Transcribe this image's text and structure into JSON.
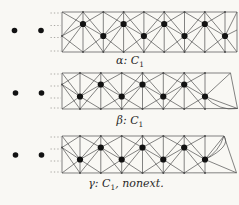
{
  "page": {
    "background": "#f9f8f4",
    "line_color": "#4f4f4f",
    "dot_color": "#121212",
    "junction_color": "#4f4f4f",
    "dashed_color": "#979490",
    "text_color": "#2a2a2a"
  },
  "strips": [
    {
      "id": "alpha",
      "label_parts": [
        {
          "text": "α: C"
        },
        {
          "text": "1",
          "sub": true
        }
      ],
      "label_pos": {
        "center_x": 130,
        "top": 55
      },
      "geom": {
        "left": 62,
        "top": 12,
        "bottom": 52,
        "dot_xs": [
          83,
          103.3,
          123.6,
          143.9,
          164.2,
          184.5,
          204.8,
          225
        ],
        "first_dot_row": "upper",
        "upper_y": 24,
        "lower_y": 36,
        "end": {
          "type": "flat",
          "right": 237
        }
      },
      "ellipsis_dots": [
        {
          "x": 14.5,
          "y": 30.5
        },
        {
          "x": 41,
          "y": 30.5
        }
      ]
    },
    {
      "id": "beta",
      "label_parts": [
        {
          "text": "β: C"
        },
        {
          "text": "1",
          "sub": true
        }
      ],
      "label_pos": {
        "center_x": 130,
        "top": 115
      },
      "geom": {
        "left": 62,
        "top": 73,
        "bottom": 109,
        "dot_xs": [
          80,
          100.8,
          121.7,
          142.5,
          163.3,
          184.2,
          205
        ],
        "first_dot_row": "lower",
        "upper_y": 84.5,
        "lower_y": 96.5,
        "end": {
          "type": "point",
          "tr": {
            "x": 230.5,
            "y": 73
          },
          "p": {
            "x": 237.5,
            "y": 108.5
          },
          "bigon": true,
          "loop": false
        }
      },
      "ellipsis_dots": [
        {
          "x": 15.5,
          "y": 93
        },
        {
          "x": 41.5,
          "y": 93
        }
      ]
    },
    {
      "id": "gamma",
      "label_parts": [
        {
          "text": "γ: C"
        },
        {
          "text": "1",
          "sub": true
        },
        {
          "text": ", nonext."
        }
      ],
      "label_pos": {
        "center_x": 126,
        "top": 178
      },
      "geom": {
        "left": 62,
        "top": 136,
        "bottom": 173,
        "dot_xs": [
          80,
          100.8,
          121.7,
          142.5,
          163.3,
          184.2,
          205
        ],
        "first_dot_row": "lower",
        "upper_y": 147.5,
        "lower_y": 159.5,
        "end": {
          "type": "point",
          "tr": {
            "x": 224,
            "y": 136
          },
          "p": {
            "x": 236.5,
            "y": 172.8
          },
          "bigon": false,
          "loop": true
        }
      },
      "ellipsis_dots": [
        {
          "x": 15.5,
          "y": 155
        },
        {
          "x": 41.5,
          "y": 155
        }
      ]
    }
  ]
}
